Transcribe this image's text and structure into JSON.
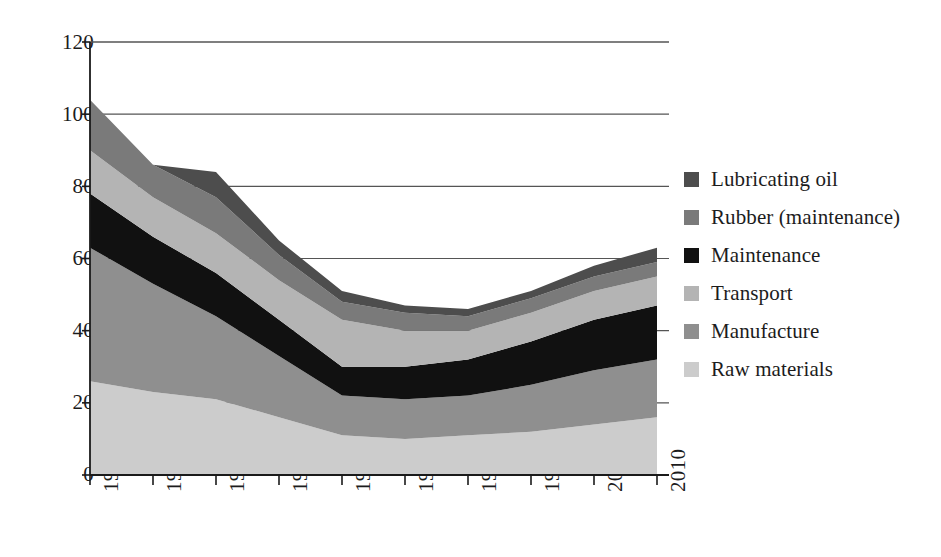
{
  "chart_data": {
    "type": "area",
    "stacked": true,
    "title": "",
    "xlabel": "",
    "ylabel": "",
    "categories": [
      "1920",
      "1930",
      "1940",
      "1950",
      "1960",
      "1970",
      "1980",
      "1990",
      "2000",
      "2010"
    ],
    "x": [
      1920,
      1930,
      1940,
      1950,
      1960,
      1970,
      1980,
      1990,
      2000,
      2010
    ],
    "ylim": [
      0,
      120
    ],
    "xlim": [
      1920,
      2010
    ],
    "yticks": [
      0,
      20,
      40,
      60,
      80,
      100,
      120
    ],
    "grid": "horizontal",
    "legend_position": "right",
    "series": [
      {
        "name": "Raw materials",
        "color": "#cccccc",
        "values": [
          26,
          23,
          21,
          16,
          11,
          10,
          11,
          12,
          14,
          16
        ]
      },
      {
        "name": "Manufacture",
        "color": "#8f8f8f",
        "values": [
          37,
          30,
          23,
          17,
          11,
          11,
          11,
          13,
          15,
          16
        ]
      },
      {
        "name": "Maintenance",
        "color": "#111111",
        "values": [
          15,
          13,
          12,
          10,
          8,
          9,
          10,
          12,
          14,
          15
        ]
      },
      {
        "name": "Transport",
        "color": "#b4b4b4",
        "values": [
          12,
          11,
          11,
          11,
          13,
          10,
          8,
          8,
          8,
          8
        ]
      },
      {
        "name": "Rubber (maintenance)",
        "color": "#7a7a7a",
        "values": [
          14,
          9,
          10,
          7,
          5,
          5,
          4,
          4,
          4,
          4
        ]
      },
      {
        "name": "Lubricating oil",
        "color": "#4d4d4d",
        "values": [
          0,
          0,
          7,
          4,
          3,
          2,
          2,
          2,
          3,
          4
        ]
      }
    ],
    "cumulative": {
      "Raw materials": [
        26,
        23,
        21,
        16,
        11,
        10,
        11,
        12,
        14,
        16
      ],
      "Manufacture": [
        63,
        53,
        44,
        33,
        22,
        21,
        22,
        25,
        29,
        32
      ],
      "Maintenance": [
        78,
        66,
        56,
        43,
        30,
        30,
        32,
        37,
        43,
        47
      ],
      "Transport": [
        90,
        77,
        67,
        54,
        43,
        40,
        40,
        45,
        51,
        55
      ],
      "Rubber (maintenance)": [
        104,
        86,
        77,
        61,
        48,
        45,
        44,
        49,
        55,
        59
      ],
      "Lubricating oil": [
        104,
        86,
        84,
        65,
        51,
        47,
        46,
        51,
        58,
        63
      ]
    }
  },
  "axes": {
    "y_tick_labels": [
      "120",
      "100",
      "80",
      "60",
      "40",
      "20",
      "0"
    ],
    "x_tick_labels": [
      "1920",
      "1930",
      "1940",
      "1950",
      "1960",
      "1970",
      "1980",
      "1990",
      "2000",
      "2010"
    ]
  },
  "legend": {
    "items": [
      {
        "label": "Lubricating oil",
        "color": "#4d4d4d"
      },
      {
        "label": "Rubber (maintenance)",
        "color": "#7a7a7a"
      },
      {
        "label": "Maintenance",
        "color": "#111111"
      },
      {
        "label": "Transport",
        "color": "#b4b4b4"
      },
      {
        "label": "Manufacture",
        "color": "#8f8f8f"
      },
      {
        "label": "Raw materials",
        "color": "#cccccc"
      }
    ]
  },
  "colors": {
    "axis": "#1a1a1a",
    "gridline": "#555555",
    "background": "#ffffff"
  }
}
